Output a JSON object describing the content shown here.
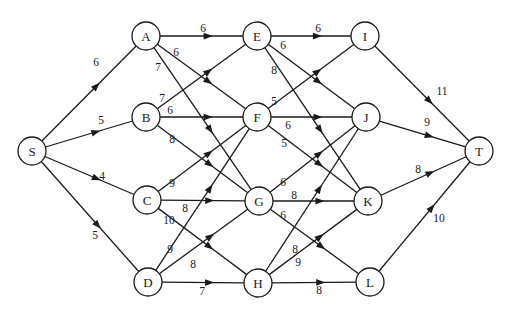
{
  "diagram": {
    "type": "directed-weighted-network",
    "source": "S",
    "sink": "T",
    "node_radius": 14,
    "nodes": [
      {
        "id": "S",
        "label": "S",
        "x": 32,
        "y": 151
      },
      {
        "id": "A",
        "label": "A",
        "x": 146,
        "y": 36
      },
      {
        "id": "B",
        "label": "B",
        "x": 146,
        "y": 117
      },
      {
        "id": "C",
        "label": "C",
        "x": 147,
        "y": 200
      },
      {
        "id": "D",
        "label": "D",
        "x": 148,
        "y": 282
      },
      {
        "id": "E",
        "label": "E",
        "x": 257,
        "y": 36
      },
      {
        "id": "F",
        "label": "F",
        "x": 257,
        "y": 117
      },
      {
        "id": "G",
        "label": "G",
        "x": 259,
        "y": 201
      },
      {
        "id": "H",
        "label": "H",
        "x": 258,
        "y": 283
      },
      {
        "id": "I",
        "label": "I",
        "x": 365,
        "y": 36
      },
      {
        "id": "J",
        "label": "J",
        "x": 366,
        "y": 117
      },
      {
        "id": "K",
        "label": "K",
        "x": 368,
        "y": 201
      },
      {
        "id": "L",
        "label": "L",
        "x": 370,
        "y": 282
      },
      {
        "id": "T",
        "label": "T",
        "x": 479,
        "y": 151
      }
    ],
    "edges": [
      {
        "from": "S",
        "to": "A",
        "weight": "6",
        "lx": 96,
        "ly": 62
      },
      {
        "from": "S",
        "to": "B",
        "weight": "5",
        "lx": 101,
        "ly": 120
      },
      {
        "from": "S",
        "to": "C",
        "weight": "4",
        "lx": 102,
        "ly": 176
      },
      {
        "from": "S",
        "to": "D",
        "weight": "5",
        "lx": 95,
        "ly": 235
      },
      {
        "from": "A",
        "to": "E",
        "weight": "6",
        "lx": 203,
        "ly": 28
      },
      {
        "from": "A",
        "to": "F",
        "weight": "6",
        "lx": 176,
        "ly": 52
      },
      {
        "from": "A",
        "to": "G",
        "weight": "7",
        "lx": 158,
        "ly": 67
      },
      {
        "from": "B",
        "to": "E",
        "weight": "7",
        "lx": 162,
        "ly": 98
      },
      {
        "from": "B",
        "to": "F",
        "weight": "6",
        "lx": 170,
        "ly": 110
      },
      {
        "from": "B",
        "to": "G",
        "weight": "8",
        "lx": 172,
        "ly": 139
      },
      {
        "from": "C",
        "to": "F",
        "weight": "9",
        "lx": 172,
        "ly": 183
      },
      {
        "from": "C",
        "to": "G",
        "weight": "8",
        "lx": 185,
        "ly": 208
      },
      {
        "from": "C",
        "to": "H",
        "weight": "10",
        "lx": 169,
        "ly": 220
      },
      {
        "from": "D",
        "to": "F",
        "weight": "9",
        "lx": 170,
        "ly": 249
      },
      {
        "from": "D",
        "to": "G",
        "weight": "8",
        "lx": 193,
        "ly": 264
      },
      {
        "from": "D",
        "to": "H",
        "weight": "7",
        "lx": 202,
        "ly": 291
      },
      {
        "from": "E",
        "to": "I",
        "weight": "6",
        "lx": 318,
        "ly": 28
      },
      {
        "from": "E",
        "to": "J",
        "weight": "6",
        "lx": 283,
        "ly": 45
      },
      {
        "from": "E",
        "to": "K",
        "weight": "8",
        "lx": 274,
        "ly": 70
      },
      {
        "from": "F",
        "to": "I",
        "weight": "5",
        "lx": 274,
        "ly": 101
      },
      {
        "from": "F",
        "to": "J",
        "weight": "6",
        "lx": 288,
        "ly": 125
      },
      {
        "from": "F",
        "to": "K",
        "weight": "5",
        "lx": 284,
        "ly": 143
      },
      {
        "from": "G",
        "to": "J",
        "weight": "6",
        "lx": 283,
        "ly": 182
      },
      {
        "from": "G",
        "to": "K",
        "weight": "8",
        "lx": 294,
        "ly": 195
      },
      {
        "from": "G",
        "to": "L",
        "weight": "6",
        "lx": 283,
        "ly": 215
      },
      {
        "from": "H",
        "to": "J",
        "weight": "8",
        "lx": 295,
        "ly": 249
      },
      {
        "from": "H",
        "to": "K",
        "weight": "9",
        "lx": 298,
        "ly": 262
      },
      {
        "from": "H",
        "to": "L",
        "weight": "8",
        "lx": 319,
        "ly": 290
      },
      {
        "from": "I",
        "to": "T",
        "weight": "11",
        "lx": 442,
        "ly": 91
      },
      {
        "from": "J",
        "to": "T",
        "weight": "9",
        "lx": 427,
        "ly": 122
      },
      {
        "from": "K",
        "to": "T",
        "weight": "8",
        "lx": 418,
        "ly": 169
      },
      {
        "from": "L",
        "to": "T",
        "weight": "10",
        "lx": 439,
        "ly": 218
      }
    ]
  }
}
